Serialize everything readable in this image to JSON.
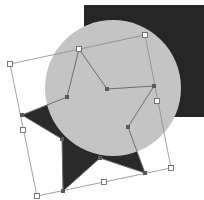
{
  "canvas": {
    "width": 204,
    "height": 200,
    "background": "#ffffff"
  },
  "colors": {
    "square_fill": "#262626",
    "circle_fill": "#c4c4c4",
    "star_fill": "#2a2a2a",
    "path_stroke": "#6e6e6e",
    "bbox_stroke": "#8a8a8a",
    "handle_fill": "#ffffff",
    "handle_stroke": "#5a5a5a",
    "anchor_fill": "#5a5a5a"
  },
  "shapes": {
    "square": {
      "x": 84,
      "y": 5,
      "width": 120,
      "height": 112
    },
    "circle": {
      "cx": 113,
      "cy": 88,
      "r": 68
    },
    "star": {
      "points": "79,49 107,89 154,86 128,127 145,173 100,158 63,191 62,139 22,115 67,97"
    }
  },
  "selection": {
    "bbox_points": "10,64 145,35 171,168 37,196",
    "handles": [
      {
        "name": "handle-top-left",
        "x": 10,
        "y": 64
      },
      {
        "name": "handle-top-middle",
        "x": 79,
        "y": 49
      },
      {
        "name": "handle-top-right",
        "x": 145,
        "y": 35
      },
      {
        "name": "handle-right-middle",
        "x": 157,
        "y": 101
      },
      {
        "name": "handle-bottom-right",
        "x": 171,
        "y": 168
      },
      {
        "name": "handle-bottom-middle",
        "x": 104,
        "y": 182
      },
      {
        "name": "handle-bottom-left",
        "x": 37,
        "y": 196
      },
      {
        "name": "handle-left-middle",
        "x": 23,
        "y": 130
      }
    ],
    "anchors": [
      {
        "x": 107,
        "y": 89
      },
      {
        "x": 154,
        "y": 86
      },
      {
        "x": 128,
        "y": 127
      },
      {
        "x": 145,
        "y": 173
      },
      {
        "x": 100,
        "y": 158
      },
      {
        "x": 63,
        "y": 191
      },
      {
        "x": 62,
        "y": 139
      },
      {
        "x": 22,
        "y": 115
      },
      {
        "x": 67,
        "y": 97
      }
    ]
  }
}
